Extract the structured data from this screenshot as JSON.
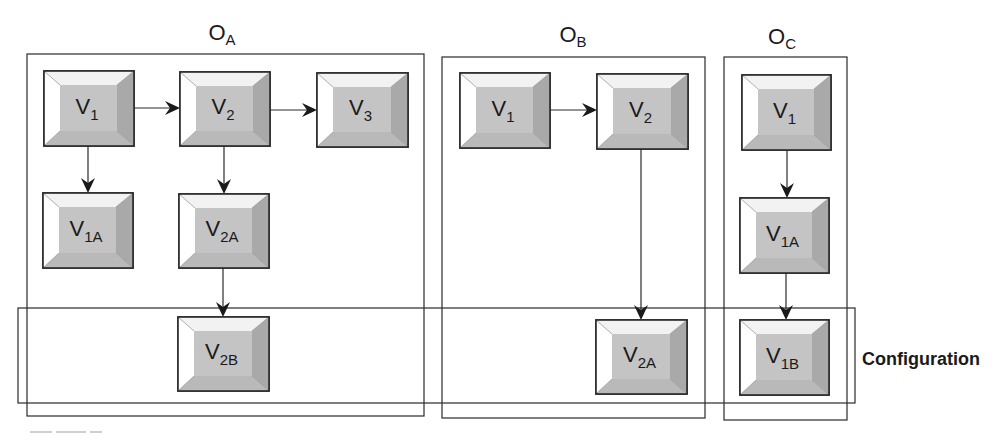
{
  "diagram": {
    "type": "grouped-flow-diagram",
    "containers": [
      {
        "id": "OA",
        "title_main": "O",
        "title_sub": "A",
        "x": 27,
        "y": 54,
        "w": 397,
        "h": 362,
        "title_x": 222,
        "title_y": 40
      },
      {
        "id": "OB",
        "title_main": "O",
        "title_sub": "B",
        "x": 442,
        "y": 57,
        "w": 263,
        "h": 361,
        "title_x": 573,
        "title_y": 42
      },
      {
        "id": "OC",
        "title_main": "O",
        "title_sub": "C",
        "x": 724,
        "y": 57,
        "w": 123,
        "h": 363,
        "title_x": 782,
        "title_y": 44
      }
    ],
    "configuration": {
      "label": "Configuration",
      "x": 18,
      "y": 308,
      "w": 837,
      "h": 95
    },
    "nodes": [
      {
        "id": "OA_V1",
        "container": "OA",
        "main": "V",
        "sub": "1",
        "x": 44,
        "y": 71,
        "w": 90,
        "h": 75
      },
      {
        "id": "OA_V2",
        "container": "OA",
        "main": "V",
        "sub": "2",
        "x": 180,
        "y": 72,
        "w": 90,
        "h": 74
      },
      {
        "id": "OA_V3",
        "container": "OA",
        "main": "V",
        "sub": "3",
        "x": 317,
        "y": 73,
        "w": 91,
        "h": 74
      },
      {
        "id": "OA_V1A",
        "container": "OA",
        "main": "V",
        "sub": "1A",
        "x": 43,
        "y": 193,
        "w": 90,
        "h": 75
      },
      {
        "id": "OA_V2A",
        "container": "OA",
        "main": "V",
        "sub": "2A",
        "x": 179,
        "y": 194,
        "w": 90,
        "h": 74
      },
      {
        "id": "OA_V2B",
        "container": "OA",
        "main": "V",
        "sub": "2B",
        "x": 178,
        "y": 317,
        "w": 91,
        "h": 74
      },
      {
        "id": "OB_V1",
        "container": "OB",
        "main": "V",
        "sub": "1",
        "x": 460,
        "y": 73,
        "w": 90,
        "h": 75
      },
      {
        "id": "OB_V2",
        "container": "OB",
        "main": "V",
        "sub": "2",
        "x": 597,
        "y": 74,
        "w": 91,
        "h": 75
      },
      {
        "id": "OB_V2A",
        "container": "OB",
        "main": "V",
        "sub": "2A",
        "x": 596,
        "y": 320,
        "w": 91,
        "h": 74
      },
      {
        "id": "OC_V1",
        "container": "OC",
        "main": "V",
        "sub": "1",
        "x": 742,
        "y": 75,
        "w": 89,
        "h": 75
      },
      {
        "id": "OC_V1A",
        "container": "OC",
        "main": "V",
        "sub": "1A",
        "x": 740,
        "y": 198,
        "w": 89,
        "h": 75
      },
      {
        "id": "OC_V1B",
        "container": "OC",
        "main": "V",
        "sub": "1B",
        "x": 740,
        "y": 320,
        "w": 89,
        "h": 75
      }
    ],
    "edges": [
      {
        "from": "OA_V1",
        "to": "OA_V2",
        "x1": 134,
        "y1": 108,
        "x2": 180,
        "y2": 108
      },
      {
        "from": "OA_V2",
        "to": "OA_V3",
        "x1": 270,
        "y1": 110,
        "x2": 317,
        "y2": 110
      },
      {
        "from": "OA_V1",
        "to": "OA_V1A",
        "x1": 88,
        "y1": 146,
        "x2": 88,
        "y2": 193
      },
      {
        "from": "OA_V2",
        "to": "OA_V2A",
        "x1": 224,
        "y1": 146,
        "x2": 224,
        "y2": 194
      },
      {
        "from": "OA_V2A",
        "to": "OA_V2B",
        "x1": 223,
        "y1": 268,
        "x2": 223,
        "y2": 317
      },
      {
        "from": "OB_V1",
        "to": "OB_V2",
        "x1": 550,
        "y1": 110,
        "x2": 597,
        "y2": 110
      },
      {
        "from": "OB_V2",
        "to": "OB_V2A",
        "x1": 641,
        "y1": 149,
        "x2": 641,
        "y2": 320
      },
      {
        "from": "OC_V1",
        "to": "OC_V1A",
        "x1": 787,
        "y1": 150,
        "x2": 787,
        "y2": 198
      },
      {
        "from": "OC_V1A",
        "to": "OC_V1B",
        "x1": 786,
        "y1": 273,
        "x2": 786,
        "y2": 320
      }
    ]
  },
  "colors": {
    "stroke": "#2a2a2a",
    "node_face": "#c4c4c4",
    "bevel_light": "#ffffff",
    "bevel_top": "#f2f2f2",
    "bevel_right": "#a9a9a9",
    "bevel_bottom": "#b9b9b9",
    "text": "#1a1a1a"
  }
}
